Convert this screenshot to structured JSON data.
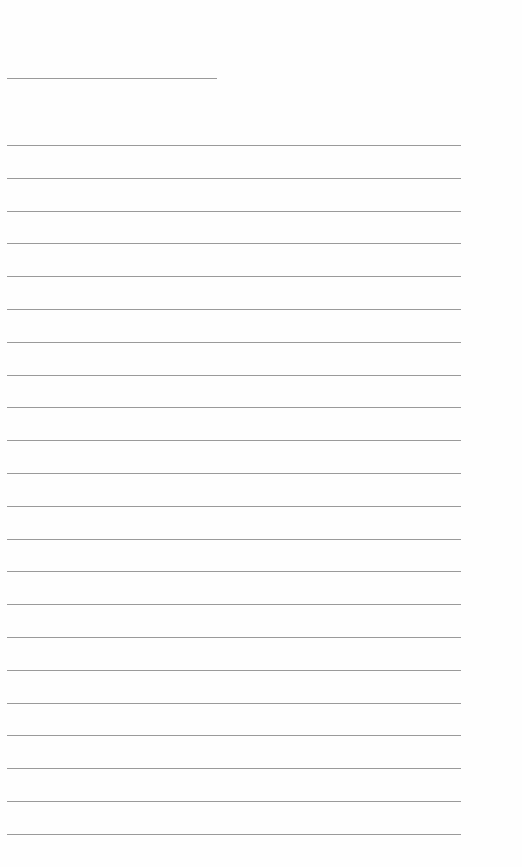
{
  "page": {
    "type": "blank lined sheet",
    "background_color": "#ffffff",
    "line_color": "#9a9a9a",
    "header_line": {
      "top": 78,
      "left": 7,
      "width": 210
    },
    "ruled_lines": {
      "count": 22,
      "first_top": 145,
      "spacing": 32.8,
      "left": 7,
      "width": 454
    }
  }
}
